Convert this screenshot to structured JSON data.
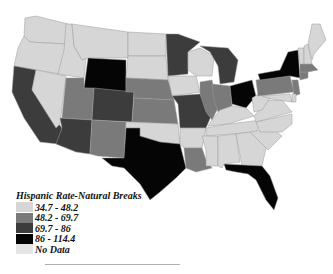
{
  "legend": {
    "title": "Hispanic Rate-Natural Breaks",
    "classes": [
      {
        "label": "34.7 - 48.2",
        "color": "#d6d6d6"
      },
      {
        "label": "48.2 - 69.7",
        "color": "#7a7a7a"
      },
      {
        "label": "69.7 - 86",
        "color": "#3c3c3c"
      },
      {
        "label": "86 - 114.4",
        "color": "#050505"
      },
      {
        "label": "No Data",
        "color": "#e6e6e6"
      }
    ]
  },
  "map": {
    "type": "choropleth",
    "region": "United States",
    "state_classes": {
      "WA": "34.7 - 48.2",
      "OR": "34.7 - 48.2",
      "ID": "34.7 - 48.2",
      "MT": "34.7 - 48.2",
      "WY": "86 - 114.4",
      "ND": "34.7 - 48.2",
      "SD": "34.7 - 48.2",
      "NV": "34.7 - 48.2",
      "CA": "69.7 - 86",
      "UT": "48.2 - 69.7",
      "CO": "69.7 - 86",
      "NE": "48.2 - 69.7",
      "KS": "48.2 - 69.7",
      "AZ": "69.7 - 86",
      "NM": "48.2 - 69.7",
      "OK": "34.7 - 48.2",
      "TX": "86 - 114.4",
      "MN": "69.7 - 86",
      "IA": "34.7 - 48.2",
      "MO": "69.7 - 86",
      "AR": "34.7 - 48.2",
      "LA": "48.2 - 69.7",
      "WI": "34.7 - 48.2",
      "IL": "48.2 - 69.7",
      "MI": "69.7 - 86",
      "IN": "48.2 - 69.7",
      "OH": "86 - 114.4",
      "KY": "34.7 - 48.2",
      "TN": "34.7 - 48.2",
      "MS": "34.7 - 48.2",
      "AL": "34.7 - 48.2",
      "GA": "34.7 - 48.2",
      "FL": "86 - 114.4",
      "SC": "34.7 - 48.2",
      "NC": "34.7 - 48.2",
      "VA": "34.7 - 48.2",
      "WV": "34.7 - 48.2",
      "PA": "48.2 - 69.7",
      "NY": "86 - 114.4",
      "NJ": "48.2 - 69.7",
      "CT": "48.2 - 69.7",
      "MA": "48.2 - 69.7",
      "VT": "34.7 - 48.2",
      "NH": "34.7 - 48.2",
      "ME": "34.7 - 48.2",
      "MD": "34.7 - 48.2",
      "DE": "34.7 - 48.2"
    }
  }
}
